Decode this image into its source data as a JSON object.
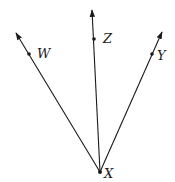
{
  "diagram": {
    "type": "rays-from-common-vertex",
    "vertex": {
      "label": "X",
      "x": 100,
      "y": 172
    },
    "rays": [
      {
        "name": "W",
        "label": "W",
        "tip": {
          "x": 16,
          "y": 33
        },
        "point": {
          "x": 29,
          "y": 54
        },
        "label_pos": {
          "x": 37,
          "y": 58
        }
      },
      {
        "name": "Z",
        "label": "Z",
        "tip": {
          "x": 92,
          "y": 10
        },
        "point": {
          "x": 94,
          "y": 39
        },
        "label_pos": {
          "x": 103,
          "y": 43
        }
      },
      {
        "name": "Y",
        "label": "Y",
        "tip": {
          "x": 162,
          "y": 32
        },
        "point": {
          "x": 152,
          "y": 54
        },
        "label_pos": {
          "x": 157,
          "y": 60
        }
      }
    ],
    "vertex_label_pos": {
      "x": 104,
      "y": 178
    },
    "stroke_color": "#1a1a1a",
    "background": "#ffffff"
  }
}
